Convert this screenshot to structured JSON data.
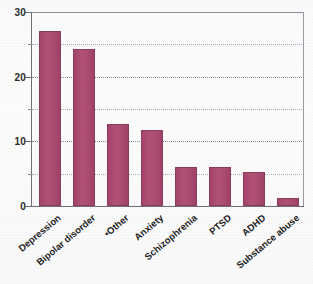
{
  "chart_data": {
    "type": "bar",
    "title": "",
    "subtitle": "",
    "xlabel": "",
    "ylabel": "",
    "categories": [
      "Depression",
      "Bipolar disorder",
      "•Other",
      "Anxiety",
      "Schizophrenia",
      "PTSD",
      "ADHD",
      "Substance abuse"
    ],
    "values": [
      27,
      24.3,
      12.7,
      11.7,
      6,
      6,
      5.3,
      1.2
    ],
    "ylim": [
      0,
      30
    ],
    "yticks": [
      0,
      10,
      20,
      30
    ],
    "ytick_labels": [
      "0",
      "10",
      "20",
      "30"
    ],
    "minor_gridlines": [
      5,
      15,
      25
    ],
    "grid": true,
    "legend": "none",
    "series": [
      {
        "name": "",
        "values": [
          27,
          24.3,
          12.7,
          11.7,
          6,
          6,
          5.3,
          1.2
        ]
      }
    ],
    "bar_color": "#a94a6e",
    "bar_edge_color": "#8d3a5c",
    "gridline_color": "#9aa0b0",
    "axis_color": "#6e6e76",
    "background_color": "#fafaf9",
    "label_rotation": -40
  }
}
